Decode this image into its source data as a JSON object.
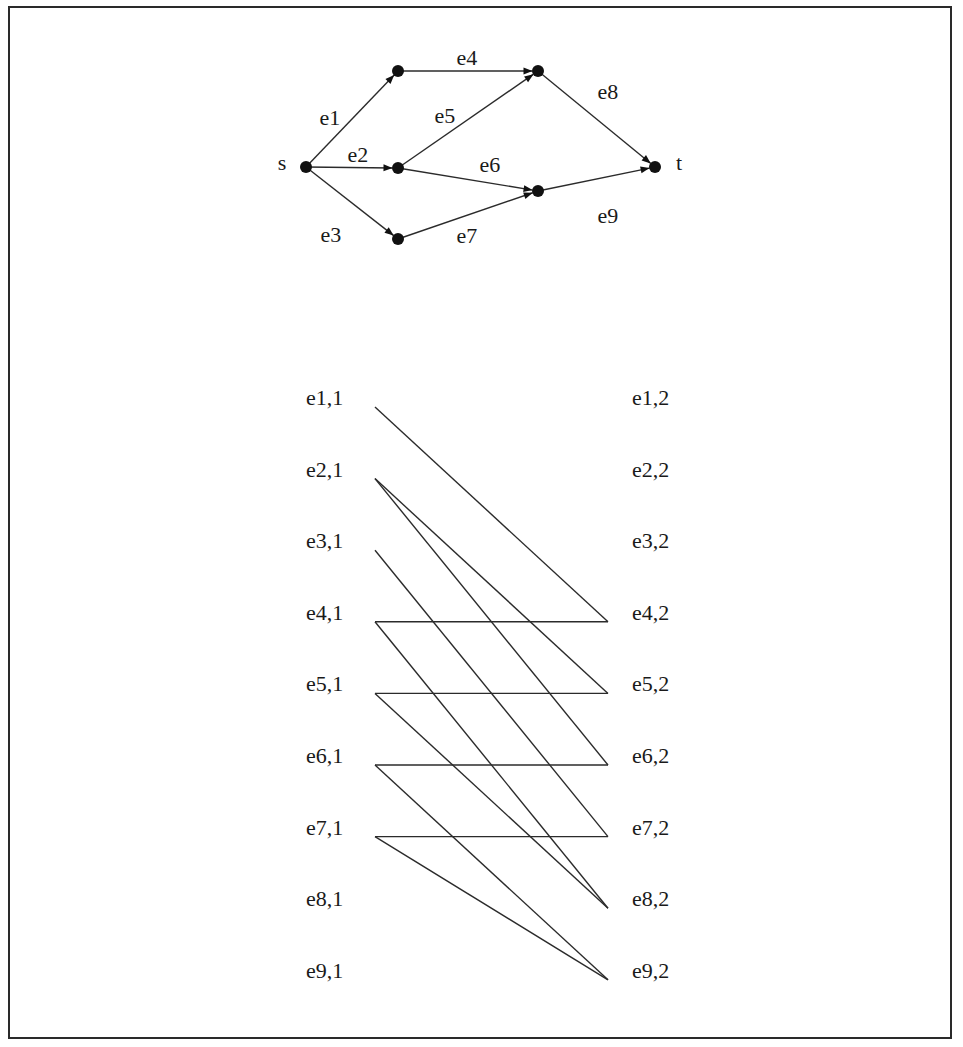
{
  "figure": {
    "top_graph": {
      "nodes": [
        {
          "id": "s",
          "label": "s",
          "x": 306,
          "y": 167,
          "label_dx": -24,
          "label_dy": 0
        },
        {
          "id": "A",
          "label": "",
          "x": 398,
          "y": 71
        },
        {
          "id": "C",
          "label": "",
          "x": 398,
          "y": 168
        },
        {
          "id": "E",
          "label": "",
          "x": 398,
          "y": 239
        },
        {
          "id": "B",
          "label": "",
          "x": 538,
          "y": 71
        },
        {
          "id": "D",
          "label": "",
          "x": 538,
          "y": 191
        },
        {
          "id": "t",
          "label": "t",
          "x": 655,
          "y": 167,
          "label_dx": 24,
          "label_dy": 0
        }
      ],
      "edges": [
        {
          "id": "e1",
          "label": "e1",
          "from": "s",
          "to": "A",
          "lx": 330,
          "ly": 120
        },
        {
          "id": "e2",
          "label": "e2",
          "from": "s",
          "to": "C",
          "lx": 358,
          "ly": 157
        },
        {
          "id": "e3",
          "label": "e3",
          "from": "s",
          "to": "E",
          "lx": 331,
          "ly": 237
        },
        {
          "id": "e4",
          "label": "e4",
          "from": "A",
          "to": "B",
          "lx": 467,
          "ly": 60
        },
        {
          "id": "e5",
          "label": "e5",
          "from": "C",
          "to": "B",
          "lx": 445,
          "ly": 118
        },
        {
          "id": "e6",
          "label": "e6",
          "from": "C",
          "to": "D",
          "lx": 490,
          "ly": 167
        },
        {
          "id": "e7",
          "label": "e7",
          "from": "E",
          "to": "D",
          "lx": 467,
          "ly": 238
        },
        {
          "id": "e8",
          "label": "e8",
          "from": "B",
          "to": "t",
          "lx": 608,
          "ly": 94
        },
        {
          "id": "e9",
          "label": "e9",
          "from": "D",
          "to": "t",
          "lx": 608,
          "ly": 218
        }
      ]
    },
    "bipartite": {
      "left_label_x": 306,
      "right_label_x": 632,
      "left_anchor_x": 375,
      "right_anchor_x": 608,
      "row_start_y": 407,
      "row_step": 71.6,
      "left_labels": [
        "e1,1",
        "e2,1",
        "e3,1",
        "e4,1",
        "e5,1",
        "e6,1",
        "e7,1",
        "e8,1",
        "e9,1"
      ],
      "right_labels": [
        "e1,2",
        "e2,2",
        "e3,2",
        "e4,2",
        "e5,2",
        "e6,2",
        "e7,2",
        "e8,2",
        "e9,2"
      ],
      "links": [
        {
          "from": "e1,1",
          "to": "e4,2"
        },
        {
          "from": "e2,1",
          "to": "e5,2"
        },
        {
          "from": "e2,1",
          "to": "e6,2"
        },
        {
          "from": "e3,1",
          "to": "e7,2"
        },
        {
          "from": "e4,1",
          "to": "e4,2"
        },
        {
          "from": "e4,1",
          "to": "e8,2"
        },
        {
          "from": "e5,1",
          "to": "e5,2"
        },
        {
          "from": "e5,1",
          "to": "e8,2"
        },
        {
          "from": "e6,1",
          "to": "e6,2"
        },
        {
          "from": "e6,1",
          "to": "e9,2"
        },
        {
          "from": "e7,1",
          "to": "e7,2"
        },
        {
          "from": "e7,1",
          "to": "e9,2"
        }
      ]
    },
    "colors": {
      "ink": "#1a1a1a",
      "background": "#ffffff",
      "border": "#2a2a2a"
    }
  }
}
